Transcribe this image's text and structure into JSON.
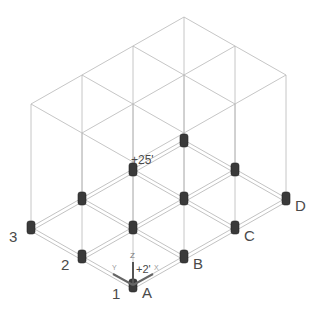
{
  "diagram": {
    "grid_lines_numbers": [
      "1",
      "2",
      "3"
    ],
    "grid_lines_letters": [
      "A",
      "B",
      "C",
      "D"
    ],
    "elevation_labels": {
      "roof": "+25'",
      "base": "+2'"
    },
    "ucs_axes": {
      "z": "Z",
      "y": "Y",
      "x": "X"
    },
    "colors": {
      "frame": "#b8b8b8",
      "column_block": "#3a3a3a",
      "label": "#4a4a4a"
    }
  }
}
